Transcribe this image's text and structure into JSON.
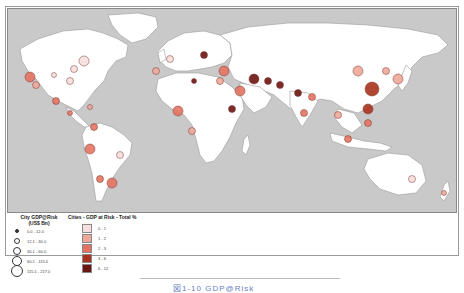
{
  "figure": {
    "caption": "図1-10 GDP@Risk",
    "colors": {
      "ocean": "#c9c9c9",
      "land": "#ffffff",
      "border": "#9a9a9a"
    }
  },
  "legend_size": {
    "title_line1": "City GDP@Risk",
    "title_line2": "(US$ Bn)",
    "items": [
      {
        "label": "0.0 - 12.0"
      },
      {
        "label": "12.1 - 30.0"
      },
      {
        "label": "30.1 - 60.0"
      },
      {
        "label": "60.1 - 115.0"
      },
      {
        "label": "115.1 - 217.0"
      }
    ]
  },
  "legend_color": {
    "title": "Cities - GDP at Risk - Total %",
    "items": [
      {
        "label": "0 - 1",
        "color": "#f6dede"
      },
      {
        "label": "1 - 2",
        "color": "#eea89a"
      },
      {
        "label": "2 - 3",
        "color": "#e47362"
      },
      {
        "label": "3 - 6",
        "color": "#a8321e"
      },
      {
        "label": "6 - 12",
        "color": "#6b1410"
      }
    ]
  },
  "cities": [
    {
      "region": "US West",
      "size_class": 3,
      "color_class": 2
    },
    {
      "region": "US West 2",
      "size_class": 2,
      "color_class": 1
    },
    {
      "region": "US Central",
      "size_class": 1,
      "color_class": 0
    },
    {
      "region": "US East",
      "size_class": 2,
      "color_class": 0
    },
    {
      "region": "US Northeast",
      "size_class": 3,
      "color_class": 0
    },
    {
      "region": "US Southeast",
      "size_class": 2,
      "color_class": 0
    },
    {
      "region": "Mexico",
      "size_class": 2,
      "color_class": 2
    },
    {
      "region": "Central America",
      "size_class": 1,
      "color_class": 2
    },
    {
      "region": "Caribbean",
      "size_class": 1,
      "color_class": 1
    },
    {
      "region": "Colombia",
      "size_class": 2,
      "color_class": 2
    },
    {
      "region": "Peru",
      "size_class": 3,
      "color_class": 2
    },
    {
      "region": "Brazil SE",
      "size_class": 2,
      "color_class": 0
    },
    {
      "region": "Chile",
      "size_class": 2,
      "color_class": 2
    },
    {
      "region": "Argentina",
      "size_class": 3,
      "color_class": 2
    },
    {
      "region": "Western Europe",
      "size_class": 2,
      "color_class": 0
    },
    {
      "region": "Spain",
      "size_class": 2,
      "color_class": 1
    },
    {
      "region": "Russia West",
      "size_class": 2,
      "color_class": 4
    },
    {
      "region": "Turkey",
      "size_class": 3,
      "color_class": 2
    },
    {
      "region": "Middle East",
      "size_class": 3,
      "color_class": 4
    },
    {
      "region": "Iran",
      "size_class": 2,
      "color_class": 4
    },
    {
      "region": "Saudi Arabia",
      "size_class": 3,
      "color_class": 2
    },
    {
      "region": "Egypt",
      "size_class": 2,
      "color_class": 1
    },
    {
      "region": "North Africa",
      "size_class": 1,
      "color_class": 4
    },
    {
      "region": "Nigeria",
      "size_class": 3,
      "color_class": 2
    },
    {
      "region": "Angola",
      "size_class": 2,
      "color_class": 1
    },
    {
      "region": "East Africa",
      "size_class": 2,
      "color_class": 4
    },
    {
      "region": "Pakistan",
      "size_class": 2,
      "color_class": 4
    },
    {
      "region": "India North",
      "size_class": 2,
      "color_class": 4
    },
    {
      "region": "India South",
      "size_class": 2,
      "color_class": 2
    },
    {
      "region": "Bangladesh",
      "size_class": 2,
      "color_class": 2
    },
    {
      "region": "China North",
      "size_class": 3,
      "color_class": 1
    },
    {
      "region": "China East",
      "size_class": 4,
      "color_class": 3
    },
    {
      "region": "China South",
      "size_class": 3,
      "color_class": 3
    },
    {
      "region": "Korea",
      "size_class": 2,
      "color_class": 1
    },
    {
      "region": "Japan",
      "size_class": 3,
      "color_class": 1
    },
    {
      "region": "Thailand",
      "size_class": 2,
      "color_class": 1
    },
    {
      "region": "Philippines",
      "size_class": 2,
      "color_class": 2
    },
    {
      "region": "Indonesia",
      "size_class": 2,
      "color_class": 2
    },
    {
      "region": "Australia East",
      "size_class": 2,
      "color_class": 0
    },
    {
      "region": "New Zealand",
      "size_class": 1,
      "color_class": 1
    }
  ]
}
